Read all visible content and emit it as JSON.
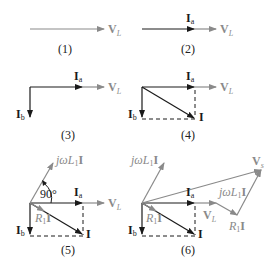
{
  "diagram": {
    "colors": {
      "dark": "#1a1a1a",
      "gray": "#8a8a8a",
      "background": "#ffffff"
    },
    "panels": [
      {
        "caption": "(1)",
        "labels": {
          "vl": "V",
          "vl_sub": "L"
        }
      },
      {
        "caption": "(2)",
        "labels": {
          "ia": "I",
          "ia_sub": "a",
          "vl": "V",
          "vl_sub": "L"
        }
      },
      {
        "caption": "(3)",
        "labels": {
          "ia": "I",
          "ia_sub": "a",
          "ib": "I",
          "ib_sub": "b",
          "vl": "V",
          "vl_sub": "L"
        }
      },
      {
        "caption": "(4)",
        "labels": {
          "ia": "I",
          "ia_sub": "a",
          "ib": "I",
          "ib_sub": "b",
          "vl": "V",
          "vl_sub": "L",
          "i": "I"
        }
      },
      {
        "caption": "(5)",
        "labels": {
          "ia": "I",
          "ia_sub": "a",
          "ib": "I",
          "ib_sub": "b",
          "vl": "V",
          "vl_sub": "L",
          "i": "I",
          "jwl": "jωL",
          "jwl_sub": "1",
          "jwl_bold": "I",
          "r1": "R",
          "r1_sub": "1",
          "r1_bold": "I",
          "angle": "90°"
        }
      },
      {
        "caption": "(6)",
        "labels": {
          "ia": "I",
          "ia_sub": "a",
          "ib": "I",
          "ib_sub": "b",
          "vl": "V",
          "vl_sub": "L",
          "i": "I",
          "jwl": "jωL",
          "jwl_sub": "1",
          "jwl_bold": "I",
          "r1": "R",
          "r1_sub": "1",
          "r1_bold": "I",
          "jwl2": "jωL",
          "jwl2_sub": "1",
          "jwl2_bold": "I",
          "r1b": "R",
          "r1b_sub": "1",
          "r1b_bold": "I",
          "vs": "V",
          "vs_sub": "s"
        }
      }
    ]
  }
}
